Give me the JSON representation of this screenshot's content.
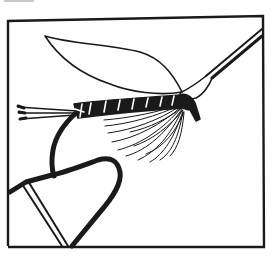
{
  "illustration": {
    "subject": "Wet fly tied on a hook held in a fly-tying vise, with hackle pliers",
    "style": "black and white line drawing",
    "colors": {
      "ink": "#1a1a1a",
      "paper": "#ffffff",
      "faint_mark": "#c8c8c8"
    },
    "parts": [
      "frame",
      "wing",
      "body",
      "ribbing",
      "head",
      "tail",
      "hackle",
      "hook",
      "vise-jaw",
      "hackle-pliers"
    ]
  }
}
